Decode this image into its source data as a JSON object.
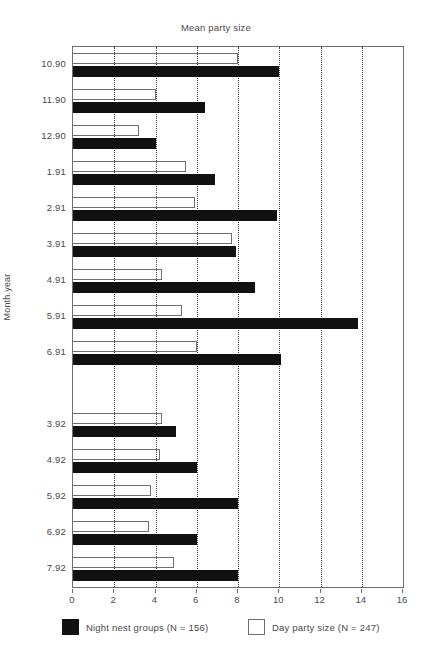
{
  "chart_data": {
    "type": "bar",
    "orientation": "horizontal",
    "title": "Mean party size",
    "xlabel": "",
    "ylabel": "Month.year",
    "xlim": [
      0,
      16
    ],
    "xticks": [
      0,
      2,
      4,
      6,
      8,
      10,
      12,
      14,
      16
    ],
    "xtick_labels": [
      "0",
      "2",
      "4",
      "6",
      "8",
      "10",
      "12",
      "14",
      "16"
    ],
    "grid": "vertical-dotted",
    "legend_position": "below-axes",
    "categories": [
      "10.90",
      "11.90",
      "12.90",
      "1.91",
      "2.91",
      "3.91",
      "4.91",
      "5.91",
      "6.91",
      "",
      "3.92",
      "4.92",
      "5.92",
      "6.92",
      "7.92"
    ],
    "series": [
      {
        "name": "Night nest groups (N = 156)",
        "color": "#111111",
        "style": "filled",
        "values": [
          10.0,
          6.4,
          4.0,
          6.9,
          9.9,
          7.9,
          8.8,
          13.8,
          10.1,
          null,
          5.0,
          6.0,
          8.0,
          6.0,
          8.0
        ]
      },
      {
        "name": "Day party size (N = 247)",
        "color": "#ffffff",
        "style": "open",
        "values": [
          8.0,
          4.0,
          3.2,
          5.5,
          5.9,
          7.7,
          4.3,
          5.3,
          6.0,
          null,
          4.3,
          4.2,
          3.8,
          3.7,
          4.9
        ]
      }
    ],
    "legend": [
      {
        "label": "Night nest groups (N = 156)",
        "swatch": "black"
      },
      {
        "label": "Day party size (N = 247)",
        "swatch": "white"
      }
    ]
  }
}
